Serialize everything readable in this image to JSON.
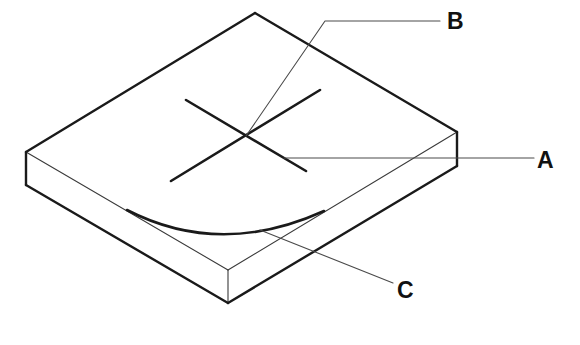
{
  "diagram": {
    "labels": [
      {
        "id": "A",
        "text": "A",
        "points_to": "cross arm (lower-right line of cross)"
      },
      {
        "id": "B",
        "text": "B",
        "points_to": "cross intersection point"
      },
      {
        "id": "C",
        "text": "C",
        "points_to": "curved arc on top surface"
      }
    ],
    "colors": {
      "line": "#1a1a1a",
      "leader": "#4a4a4a",
      "background": "#ffffff"
    }
  }
}
